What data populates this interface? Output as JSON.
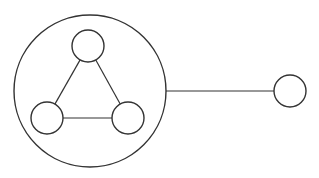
{
  "diagram": {
    "width": 319,
    "height": 178,
    "stroke": "#333333",
    "background": "#ffffff",
    "container": {
      "id": "group",
      "cx": 90,
      "cy": 91,
      "r": 76
    },
    "nodes": [
      {
        "id": "top",
        "cx": 88,
        "cy": 46,
        "r": 16
      },
      {
        "id": "bottom-left",
        "cx": 47,
        "cy": 118,
        "r": 16
      },
      {
        "id": "bottom-right",
        "cx": 128,
        "cy": 118,
        "r": 16
      },
      {
        "id": "external",
        "cx": 290,
        "cy": 91,
        "r": 16
      }
    ],
    "edges": [
      {
        "from": "top",
        "to": "bottom-left"
      },
      {
        "from": "top",
        "to": "bottom-right"
      },
      {
        "from": "bottom-left",
        "to": "bottom-right"
      },
      {
        "from": "group",
        "to": "external"
      }
    ]
  }
}
